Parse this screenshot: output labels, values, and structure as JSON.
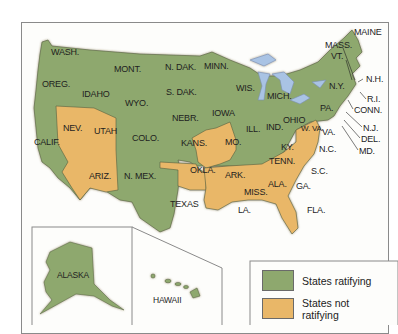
{
  "colors": {
    "ratifying": "#8ea86e",
    "not_ratifying": "#e9b768",
    "water": "#a9c3e4",
    "border": "#8a8a8a"
  },
  "states": {
    "wash": "WASH.",
    "oreg": "OREG.",
    "calif": "CALIF.",
    "idaho": "IDAHO",
    "nev": "NEV.",
    "utah": "UTAH",
    "ariz": "ARIZ.",
    "mont": "MONT.",
    "wyo": "WYO.",
    "colo": "COLO.",
    "nmex": "N. MEX.",
    "ndak": "N. DAK.",
    "sdak": "S. DAK.",
    "nebr": "NEBR.",
    "kans": "KANS.",
    "okla": "OKLA.",
    "texas": "TEXAS",
    "minn": "MINN.",
    "iowa": "IOWA",
    "mo": "MO.",
    "ark": "ARK.",
    "la": "LA.",
    "wis": "WIS.",
    "ill": "ILL.",
    "mich": "MICH.",
    "ind": "IND.",
    "ohio": "OHIO",
    "ky": "KY.",
    "tenn": "TENN.",
    "miss": "MISS.",
    "ala": "ALA.",
    "ga": "GA.",
    "fla": "FLA.",
    "sc": "S.C.",
    "nc": "N.C.",
    "va": "VA.",
    "wva": "W. VA.",
    "pa": "PA.",
    "ny": "N.Y.",
    "vt": "VT.",
    "nh": "N.H.",
    "maine": "MAINE",
    "mass": "MASS.",
    "ri": "R.I.",
    "conn": "CONN.",
    "nj": "N.J.",
    "del": "DEL.",
    "md": "MD.",
    "alaska": "ALASKA",
    "hawaii": "HAWAII"
  },
  "legend": {
    "ratifying_label": "States ratifying",
    "not_ratifying_label_1": "States not",
    "not_ratifying_label_2": "ratifying"
  },
  "classification": {
    "ratifying": [
      "WASH.",
      "OREG.",
      "CALIF.",
      "IDAHO",
      "MONT.",
      "WYO.",
      "COLO.",
      "N. MEX.",
      "N. DAK.",
      "S. DAK.",
      "NEBR.",
      "KANS.",
      "TEXAS",
      "MINN.",
      "IOWA",
      "WIS.",
      "MICH.",
      "IND.",
      "OHIO",
      "W. VA.",
      "KY.",
      "TENN.",
      "PA.",
      "N.Y.",
      "VT.",
      "N.H.",
      "MAINE",
      "MASS.",
      "R.I.",
      "CONN.",
      "N.J.",
      "DEL.",
      "ALASKA",
      "HAWAII"
    ],
    "not_ratifying": [
      "NEV.",
      "UTAH",
      "ARIZ.",
      "OKLA.",
      "MO.",
      "ILL.",
      "ARK.",
      "LA.",
      "MISS.",
      "ALA.",
      "GA.",
      "FLA.",
      "S.C.",
      "N.C.",
      "VA."
    ]
  }
}
